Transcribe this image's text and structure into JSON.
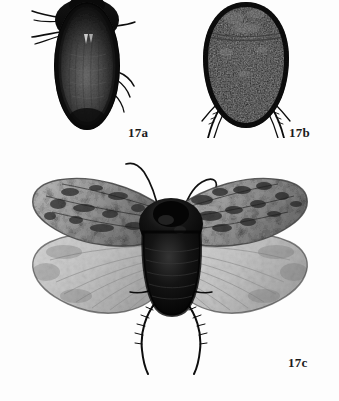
{
  "plate": {
    "title": "Figure 17 insect specimen plate",
    "background_color": "#fdfdfd",
    "ink_color": "#111111",
    "media": "black-and-white photographic plate",
    "panel_count": 3
  },
  "labels": {
    "a": "17a",
    "b": "17b",
    "c": "17c"
  },
  "specimens": [
    {
      "id": "17a",
      "label": "17a",
      "view": "dorsal",
      "shape": "elongate oval",
      "description": "Dark elongate oval insect, dorsal view, antennae and legs projecting to the left, finely textured grey elytra with darker margins",
      "tone": "very dark brown-black with mid-grey textured center",
      "has_wings_spread": false,
      "appendages": [
        "antenna-left",
        "leg-foreleg-left",
        "leg-midleg-right",
        "leg-hindleg-right"
      ]
    },
    {
      "id": "17b",
      "label": "17b",
      "view": "dorsal",
      "shape": "rounded teardrop",
      "description": "Broad rounded teardrop-shaped dark insect, dorsal view, transverse pronotal band near the top, spiny legs emerging at lower left and lower right",
      "tone": "uniform black with faint speckled highlights",
      "has_wings_spread": false,
      "appendages": [
        "leg-hindleg-left",
        "leg-hindleg-right"
      ]
    },
    {
      "id": "17c",
      "label": "17c",
      "view": "dorsal, wings spread",
      "shape": "winged insect with outspread wings",
      "description": "Winged insect with wings spread, mottled speckled grey forewings above and paler veined hindwings below, dark body, two long curved antennae, spiny hind legs trailing below",
      "tone": "black body, mottled grey forewings, pale grey translucent hindwings",
      "has_wings_spread": true,
      "appendages": [
        "antenna-left",
        "antenna-right",
        "leg-hindleg-left",
        "leg-hindleg-right"
      ],
      "wing_pairs": [
        "forewing-left",
        "forewing-right",
        "hindwing-left",
        "hindwing-right"
      ]
    }
  ]
}
